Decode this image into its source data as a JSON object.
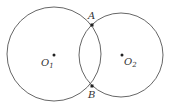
{
  "diagram": {
    "type": "two intersecting circles",
    "circles": [
      {
        "id": "circle-1",
        "center_label": "O",
        "center_sub": "1",
        "cx": 54,
        "cy": 54,
        "r": 47
      },
      {
        "id": "circle-2",
        "center_label": "O",
        "center_sub": "2",
        "cx": 121,
        "cy": 55,
        "r": 42
      }
    ],
    "points": [
      {
        "label": "A",
        "x": 92,
        "y": 25
      },
      {
        "label": "B",
        "x": 92,
        "y": 86
      }
    ],
    "stroke_color": "#555555",
    "point_color": "#222222"
  }
}
